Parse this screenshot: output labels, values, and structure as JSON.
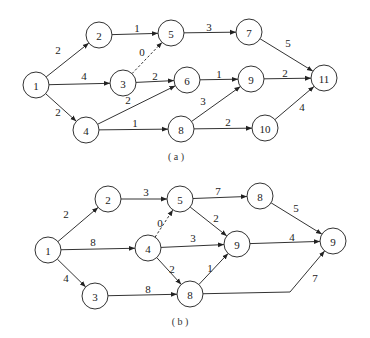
{
  "diagrams": [
    {
      "id": "a",
      "caption": "( a )",
      "caption_pos": [
        176,
        156
      ],
      "node_radius": 13,
      "nodes": [
        {
          "id": "1",
          "label": "1",
          "x": 36,
          "y": 85
        },
        {
          "id": "2",
          "label": "2",
          "x": 99,
          "y": 35
        },
        {
          "id": "3",
          "label": "3",
          "x": 123,
          "y": 83
        },
        {
          "id": "4",
          "label": "4",
          "x": 86,
          "y": 130
        },
        {
          "id": "5",
          "label": "5",
          "x": 171,
          "y": 33
        },
        {
          "id": "6",
          "label": "6",
          "x": 187,
          "y": 80
        },
        {
          "id": "7",
          "label": "7",
          "x": 249,
          "y": 32
        },
        {
          "id": "8",
          "label": "8",
          "x": 181,
          "y": 129
        },
        {
          "id": "9",
          "label": "9",
          "x": 251,
          "y": 79
        },
        {
          "id": "10",
          "label": "10",
          "x": 265,
          "y": 128
        },
        {
          "id": "11",
          "label": "11",
          "x": 324,
          "y": 78
        }
      ],
      "edges": [
        {
          "from": "1",
          "to": "2",
          "weight": "2",
          "label_pos": [
            58,
            50
          ]
        },
        {
          "from": "1",
          "to": "3",
          "weight": "4",
          "label_pos": [
            84,
            76
          ]
        },
        {
          "from": "1",
          "to": "4",
          "weight": "2",
          "label_pos": [
            58,
            112
          ]
        },
        {
          "from": "2",
          "to": "5",
          "weight": "1",
          "label_pos": [
            137,
            28
          ]
        },
        {
          "from": "3",
          "to": "5",
          "weight": "0",
          "label_pos": [
            142,
            52
          ],
          "dashed": true
        },
        {
          "from": "3",
          "to": "6",
          "weight": "2",
          "label_pos": [
            155,
            76
          ]
        },
        {
          "from": "4",
          "to": "6",
          "weight": "2",
          "label_pos": [
            128,
            100
          ]
        },
        {
          "from": "4",
          "to": "8",
          "weight": "1",
          "label_pos": [
            135,
            123
          ]
        },
        {
          "from": "5",
          "to": "7",
          "weight": "3",
          "label_pos": [
            209,
            27
          ]
        },
        {
          "from": "6",
          "to": "9",
          "weight": "1",
          "label_pos": [
            219,
            74
          ]
        },
        {
          "from": "7",
          "to": "11",
          "weight": "5",
          "label_pos": [
            288,
            43
          ]
        },
        {
          "from": "9",
          "to": "11",
          "weight": "2",
          "label_pos": [
            285,
            73
          ]
        },
        {
          "from": "8",
          "to": "9",
          "weight": "3",
          "label_pos": [
            203,
            101
          ]
        },
        {
          "from": "8",
          "to": "10",
          "weight": "2",
          "label_pos": [
            228,
            122
          ]
        },
        {
          "from": "10",
          "to": "11",
          "weight": "4",
          "label_pos": [
            302,
            107
          ]
        }
      ]
    },
    {
      "id": "b",
      "caption": "( b )",
      "caption_pos": [
        180,
        321
      ],
      "node_radius": 13,
      "nodes": [
        {
          "id": "1",
          "label": "1",
          "x": 48,
          "y": 250
        },
        {
          "id": "2",
          "label": "2",
          "x": 108,
          "y": 199
        },
        {
          "id": "3",
          "label": "3",
          "x": 95,
          "y": 296
        },
        {
          "id": "4",
          "label": "4",
          "x": 148,
          "y": 248
        },
        {
          "id": "5",
          "label": "5",
          "x": 180,
          "y": 199
        },
        {
          "id": "6",
          "label": "8",
          "x": 260,
          "y": 196
        },
        {
          "id": "7",
          "label": "9",
          "x": 237,
          "y": 244
        },
        {
          "id": "8",
          "label": "8",
          "x": 190,
          "y": 294
        },
        {
          "id": "9",
          "label": "9",
          "x": 333,
          "y": 241
        }
      ],
      "edges": [
        {
          "from": "1",
          "to": "2",
          "weight": "2",
          "label_pos": [
            66,
            214
          ]
        },
        {
          "from": "1",
          "to": "4",
          "weight": "8",
          "label_pos": [
            93,
            242
          ]
        },
        {
          "from": "1",
          "to": "3",
          "weight": "4",
          "label_pos": [
            66,
            278
          ]
        },
        {
          "from": "2",
          "to": "5",
          "weight": "3",
          "label_pos": [
            146,
            192
          ]
        },
        {
          "from": "4",
          "to": "5",
          "weight": "0",
          "label_pos": [
            160,
            223
          ],
          "dashed": true
        },
        {
          "from": "4",
          "to": "7",
          "weight": "3",
          "label_pos": [
            193,
            238
          ]
        },
        {
          "from": "4",
          "to": "8",
          "weight": "2",
          "label_pos": [
            172,
            269
          ]
        },
        {
          "from": "3",
          "to": "8",
          "weight": "8",
          "label_pos": [
            148,
            289
          ]
        },
        {
          "from": "5",
          "to": "6",
          "weight": "7",
          "label_pos": [
            218,
            191
          ]
        },
        {
          "from": "5",
          "to": "7",
          "weight": "2",
          "label_pos": [
            216,
            218
          ]
        },
        {
          "from": "8",
          "to": "7",
          "weight": "1",
          "label_pos": [
            210,
            268
          ]
        },
        {
          "from": "6",
          "to": "9",
          "weight": "5",
          "label_pos": [
            296,
            208
          ]
        },
        {
          "from": "7",
          "to": "9",
          "weight": "4",
          "label_pos": [
            292,
            237
          ]
        },
        {
          "from": "8",
          "to": "9",
          "weight": "7",
          "label_pos": [
            315,
            278
          ],
          "via": [
            290,
            292
          ]
        }
      ]
    }
  ]
}
